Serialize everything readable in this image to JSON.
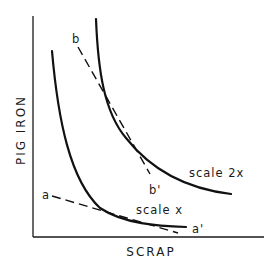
{
  "diagram": {
    "type": "isoquant",
    "axes": {
      "x_label": "SCRAP",
      "y_label": "PIG IRON"
    },
    "curves": [
      {
        "id": "scale-x",
        "label": "scale x"
      },
      {
        "id": "scale-2x",
        "label": "scale 2x"
      }
    ],
    "lines": [
      {
        "id": "aa",
        "start_label": "a",
        "end_label": "a'"
      },
      {
        "id": "bb",
        "start_label": "b",
        "end_label": "b'"
      }
    ]
  }
}
